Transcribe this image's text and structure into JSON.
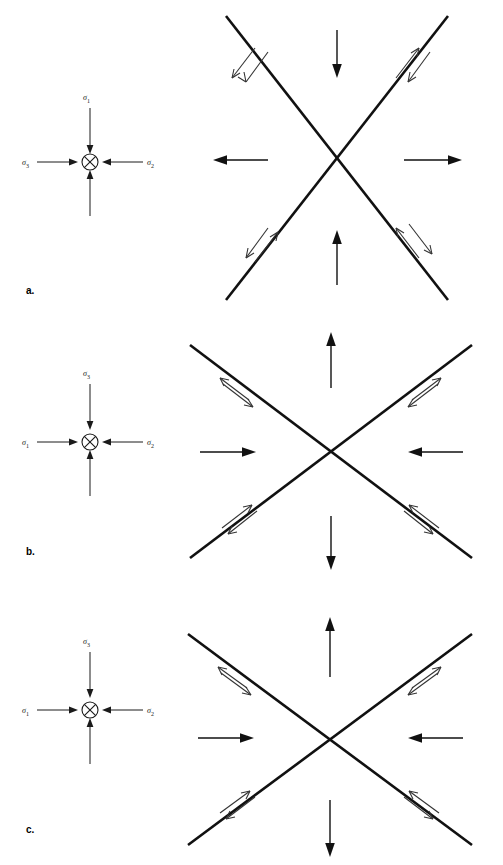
{
  "figure": {
    "kind": "geologic stress / fault diagram",
    "background_color": "#ffffff",
    "line_color": "#111111",
    "shear_arrow_color": "#333333"
  },
  "panels": [
    {
      "id": "a",
      "label": "a.",
      "stress_symbol": {
        "name": "stress-symbol-a",
        "center_glyph": "circle-x",
        "center_glyph_meaning": "sigma axis into page",
        "axes": [
          {
            "position": "top",
            "label_sigma": "σ",
            "label_subscript": "1",
            "arrow_direction": "down",
            "sense": "inward"
          },
          {
            "position": "left",
            "label_sigma": "σ",
            "label_subscript": "3",
            "arrow_direction": "right",
            "sense": "inward"
          },
          {
            "position": "right",
            "label_sigma": "σ",
            "label_subscript": "2",
            "arrow_direction": "left",
            "sense": "inward"
          },
          {
            "position": "bottom",
            "label_sigma": "",
            "label_subscript": "",
            "arrow_direction": "up",
            "sense": "inward"
          }
        ]
      },
      "fault_diagram": {
        "name": "fault-diagram-a",
        "pattern": "conjugate-x",
        "bulk_arrows": [
          {
            "position": "top",
            "direction": "down",
            "sense": "inward"
          },
          {
            "position": "bottom",
            "direction": "up",
            "sense": "inward"
          },
          {
            "position": "left",
            "direction": "left",
            "sense": "outward"
          },
          {
            "position": "right",
            "direction": "right",
            "sense": "outward"
          }
        ],
        "shear_pairs": [
          {
            "limb": "upper-left",
            "outer_half_arrow": "up-right",
            "inner_half_arrow": "down-left"
          },
          {
            "limb": "upper-right",
            "outer_half_arrow": "up-right",
            "inner_half_arrow": "down-left"
          },
          {
            "limb": "lower-left",
            "outer_half_arrow": "up-right",
            "inner_half_arrow": "down-left"
          },
          {
            "limb": "lower-right",
            "outer_half_arrow": "up-right",
            "inner_half_arrow": "down-left"
          }
        ]
      }
    },
    {
      "id": "b",
      "label": "b.",
      "stress_symbol": {
        "name": "stress-symbol-b",
        "center_glyph": "circle-x",
        "center_glyph_meaning": "sigma axis into page",
        "axes": [
          {
            "position": "top",
            "label_sigma": "σ",
            "label_subscript": "3",
            "arrow_direction": "down",
            "sense": "inward"
          },
          {
            "position": "left",
            "label_sigma": "σ",
            "label_subscript": "1",
            "arrow_direction": "right",
            "sense": "inward"
          },
          {
            "position": "right",
            "label_sigma": "σ",
            "label_subscript": "2",
            "arrow_direction": "left",
            "sense": "inward"
          },
          {
            "position": "bottom",
            "label_sigma": "",
            "label_subscript": "",
            "arrow_direction": "up",
            "sense": "inward"
          }
        ]
      },
      "fault_diagram": {
        "name": "fault-diagram-b",
        "pattern": "conjugate-x",
        "bulk_arrows": [
          {
            "position": "top",
            "direction": "up",
            "sense": "outward"
          },
          {
            "position": "bottom",
            "direction": "down",
            "sense": "outward"
          },
          {
            "position": "left",
            "direction": "right",
            "sense": "inward"
          },
          {
            "position": "right",
            "direction": "left",
            "sense": "inward"
          }
        ],
        "shear_pairs": [
          {
            "limb": "upper-left",
            "outer_half_arrow": "up-left",
            "inner_half_arrow": "down-right"
          },
          {
            "limb": "upper-right",
            "outer_half_arrow": "up-right",
            "inner_half_arrow": "down-left"
          },
          {
            "limb": "lower-left",
            "outer_half_arrow": "up-right",
            "inner_half_arrow": "down-left"
          },
          {
            "limb": "lower-right",
            "outer_half_arrow": "up-left",
            "inner_half_arrow": "down-right"
          }
        ]
      }
    },
    {
      "id": "c",
      "label": "c.",
      "stress_symbol": {
        "name": "stress-symbol-c",
        "center_glyph": "circle-x",
        "center_glyph_meaning": "sigma axis into page",
        "axes": [
          {
            "position": "top",
            "label_sigma": "σ",
            "label_subscript": "3",
            "arrow_direction": "down",
            "sense": "inward"
          },
          {
            "position": "left",
            "label_sigma": "σ",
            "label_subscript": "1",
            "arrow_direction": "right",
            "sense": "inward"
          },
          {
            "position": "right",
            "label_sigma": "σ",
            "label_subscript": "2",
            "arrow_direction": "left",
            "sense": "inward"
          },
          {
            "position": "bottom",
            "label_sigma": "",
            "label_subscript": "",
            "arrow_direction": "up",
            "sense": "inward"
          }
        ]
      },
      "fault_diagram": {
        "name": "fault-diagram-c",
        "pattern": "conjugate-x",
        "bulk_arrows": [
          {
            "position": "top",
            "direction": "up",
            "sense": "outward"
          },
          {
            "position": "bottom",
            "direction": "down",
            "sense": "outward"
          },
          {
            "position": "left",
            "direction": "right",
            "sense": "inward"
          },
          {
            "position": "right",
            "direction": "left",
            "sense": "inward"
          }
        ],
        "shear_pairs": [
          {
            "limb": "upper-left",
            "outer_half_arrow": "up-left",
            "inner_half_arrow": "down-right"
          },
          {
            "limb": "upper-right",
            "outer_half_arrow": "up-right",
            "inner_half_arrow": "down-left"
          },
          {
            "limb": "lower-left",
            "outer_half_arrow": "up-right",
            "inner_half_arrow": "down-left"
          },
          {
            "limb": "lower-right",
            "outer_half_arrow": "up-left",
            "inner_half_arrow": "down-right"
          }
        ]
      }
    }
  ]
}
